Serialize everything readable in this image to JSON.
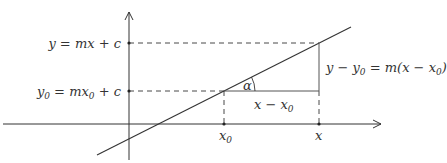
{
  "diagram": {
    "y_labels": {
      "y_eq": "y = mx + c",
      "y0_eq_pre": "y",
      "y0_sub": "0",
      "y0_eq_mid": " = mx",
      "y0_sub2": "0",
      "y0_eq_post": " + c"
    },
    "x_labels": {
      "x0": "x",
      "x0_sub": "0",
      "x": "x"
    },
    "angle_label": "α",
    "run_label": {
      "pre": "x − x",
      "sub": "0"
    },
    "rise_label": {
      "pre": "y − y",
      "sub": "0",
      "mid": " = m(x − x",
      "sub2": "0",
      "post": ")"
    },
    "colors": {
      "line": "#333333",
      "text": "#333333"
    }
  }
}
